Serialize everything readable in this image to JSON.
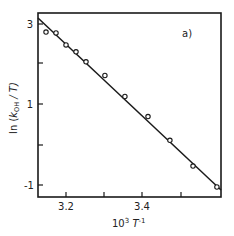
{
  "chart_data": {
    "type": "scatter",
    "title": "",
    "panel_label": "a)",
    "xlabel": "10³ T⁻¹",
    "ylabel": "ln (k_OH / T)",
    "xlim": [
      3.128,
      3.6
    ],
    "ylim": [
      -1.28,
      3.27
    ],
    "x_ticks": [
      3.2,
      3.3,
      3.4,
      3.5
    ],
    "x_tick_labels": [
      "3.2",
      "",
      "3.4",
      ""
    ],
    "y_ticks": [
      -1,
      0,
      1,
      2,
      3
    ],
    "y_tick_labels": [
      "-1",
      "",
      "1",
      "",
      "3"
    ],
    "grid": false,
    "legend": null,
    "series": [
      {
        "name": "measured",
        "marker": "open-circle",
        "x": [
          3.148,
          3.174,
          3.2,
          3.226,
          3.252,
          3.301,
          3.353,
          3.413,
          3.47,
          3.53,
          3.592
        ],
        "y": [
          2.8,
          2.78,
          2.48,
          2.31,
          2.06,
          1.72,
          1.2,
          0.7,
          0.11,
          -0.53,
          -1.05
        ]
      },
      {
        "name": "linear fit",
        "marker": "line",
        "x": [
          3.128,
          3.6
        ],
        "y": [
          3.1,
          -1.12
        ]
      }
    ]
  },
  "labels": {
    "panel": "a)",
    "ylabel_prefix": "ln (",
    "ylabel_k": "k",
    "ylabel_sub": "OH",
    "ylabel_suffix": " / T)",
    "xlabel_base": "10",
    "xlabel_exp": "3",
    "xlabel_T": " T",
    "xlabel_T_exp": "-1",
    "ytick_3": "3",
    "ytick_1": "1",
    "ytick_m1": "-1",
    "xtick_32": "3.2",
    "xtick_34": "3.4"
  }
}
